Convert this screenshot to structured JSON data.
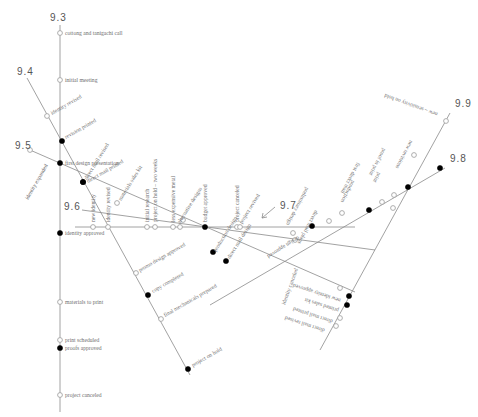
{
  "diagram": {
    "lines": [
      {
        "id": "9.3",
        "label": "9.3",
        "x1": 60,
        "y1": 25,
        "x2": 60,
        "y2": 412,
        "label_x": 50,
        "label_y": 21
      },
      {
        "id": "9.4",
        "label": "9.4",
        "x1": 27,
        "y1": 78,
        "x2": 190,
        "y2": 375,
        "label_x": 17,
        "label_y": 75
      },
      {
        "id": "9.5",
        "label": "9.5",
        "x1": 30,
        "y1": 150,
        "x2": 355,
        "y2": 292,
        "label_x": 15,
        "label_y": 149
      },
      {
        "id": "9.6",
        "label": "9.6",
        "x1": 82,
        "y1": 210,
        "x2": 375,
        "y2": 250,
        "label_x": 64,
        "label_y": 210
      },
      {
        "id": "9.7",
        "label": "9.7",
        "x1": 75,
        "y1": 227,
        "x2": 355,
        "y2": 227,
        "label_x": 280,
        "label_y": 209
      },
      {
        "id": "9.8",
        "label": "9.8",
        "x1": 210,
        "y1": 305,
        "x2": 445,
        "y2": 168,
        "label_x": 450,
        "label_y": 162
      },
      {
        "id": "9.9",
        "label": "9.9",
        "x1": 320,
        "y1": 350,
        "x2": 450,
        "y2": 113,
        "label_x": 455,
        "label_y": 107
      }
    ],
    "arrow": {
      "x1": 262,
      "y1": 218,
      "x2": 275,
      "y2": 207
    },
    "events": [
      {
        "line": "9.3",
        "x": 60,
        "y": 33,
        "filled": false,
        "label": "cottong and tanigachi call",
        "lx": 65,
        "ly": 35,
        "rot": 0
      },
      {
        "line": "9.3",
        "x": 60,
        "y": 80,
        "filled": false,
        "label": "initial meeting",
        "lx": 65,
        "ly": 82,
        "rot": 0
      },
      {
        "line": "9.3",
        "x": 60,
        "y": 163,
        "filled": true,
        "label": "first design presentation",
        "lx": 65,
        "ly": 165,
        "rot": 0
      },
      {
        "line": "9.3",
        "x": 60,
        "y": 233,
        "filled": true,
        "label": "identity approved",
        "lx": 65,
        "ly": 235,
        "rot": 0
      },
      {
        "line": "9.3",
        "x": 60,
        "y": 302,
        "filled": false,
        "label": "materials to print",
        "lx": 65,
        "ly": 304,
        "rot": 0
      },
      {
        "line": "9.3",
        "x": 60,
        "y": 340,
        "filled": false,
        "label": "print scheduled",
        "lx": 65,
        "ly": 342,
        "rot": 0
      },
      {
        "line": "9.3",
        "x": 60,
        "y": 348,
        "filled": true,
        "label": "proofs approved",
        "lx": 65,
        "ly": 350,
        "rot": 0
      },
      {
        "line": "9.3",
        "x": 60,
        "y": 395,
        "filled": false,
        "label": "project canceled",
        "lx": 65,
        "ly": 397,
        "rot": 0
      },
      {
        "line": "9.4",
        "x": 47,
        "y": 116,
        "filled": false,
        "label": "identity revised",
        "lx": 52,
        "ly": 115,
        "rot": -30
      },
      {
        "line": "9.4",
        "x": 62,
        "y": 141,
        "filled": true,
        "label": "revision printed",
        "lx": 66,
        "ly": 139,
        "rot": -30
      },
      {
        "line": "9.4",
        "x": 83,
        "y": 182,
        "filled": true,
        "label": "direct mail revised",
        "lx": 87,
        "ly": 180,
        "rot": -58
      },
      {
        "line": "9.4",
        "x": 83,
        "y": 182,
        "filled": true,
        "label": "direct mail printed",
        "lx": 88,
        "ly": 183,
        "rot": -30
      },
      {
        "line": "9.4",
        "x": 136,
        "y": 273,
        "filled": false,
        "label": "promo design approved",
        "lx": 140,
        "ly": 272,
        "rot": -30
      },
      {
        "line": "9.4",
        "x": 148,
        "y": 295,
        "filled": true,
        "label": "copy completed",
        "lx": 153,
        "ly": 293,
        "rot": -30
      },
      {
        "line": "9.4",
        "x": 161,
        "y": 319,
        "filled": false,
        "label": "final mechanicals prepared",
        "lx": 165,
        "ly": 317,
        "rot": -30
      },
      {
        "line": "9.4",
        "x": 188,
        "y": 369,
        "filled": true,
        "label": "project on hold",
        "lx": 193,
        "ly": 367,
        "rot": -30
      },
      {
        "line": "9.5",
        "x": 117,
        "y": 203,
        "filled": false,
        "label": "materials sales kit",
        "lx": 121,
        "ly": 201,
        "rot": -58
      },
      {
        "line": "9.5",
        "x": 213,
        "y": 252,
        "filled": true,
        "label": "production design",
        "lx": 216,
        "ly": 252,
        "rot": -58
      },
      {
        "line": "9.5",
        "x": 226,
        "y": 261,
        "filled": true,
        "label": "direct mail design",
        "lx": 230,
        "ly": 259,
        "rot": -58
      },
      {
        "line": "9.5",
        "x": 340,
        "y": 288,
        "filled": false,
        "label": "",
        "lx": 0,
        "ly": 0,
        "rot": 0
      },
      {
        "line": "9.6",
        "x": 183,
        "y": 220,
        "filled": false,
        "label": "",
        "lx": 0,
        "ly": 0,
        "rot": 0
      },
      {
        "line": "9.7",
        "x": 93,
        "y": 227,
        "filled": false,
        "label": "new identity",
        "lx": 95,
        "ly": 222,
        "rot": -90
      },
      {
        "line": "9.7",
        "x": 108,
        "y": 227,
        "filled": false,
        "label": "identity revised",
        "lx": 110,
        "ly": 222,
        "rot": -90
      },
      {
        "line": "9.7",
        "x": 147,
        "y": 227,
        "filled": false,
        "label": "initial research",
        "lx": 149,
        "ly": 222,
        "rot": -90
      },
      {
        "line": "9.7",
        "x": 155,
        "y": 227,
        "filled": false,
        "label": "project on hold – two weeks",
        "lx": 157,
        "ly": 222,
        "rot": -90
      },
      {
        "line": "9.7",
        "x": 173,
        "y": 227,
        "filled": false,
        "label": "less expensive metal",
        "lx": 175,
        "ly": 222,
        "rot": -90
      },
      {
        "line": "9.7",
        "x": 180,
        "y": 227,
        "filled": false,
        "label": "alternative designs",
        "lx": 180,
        "ly": 224,
        "rot": -58
      },
      {
        "line": "9.7",
        "x": 205,
        "y": 227,
        "filled": true,
        "label": "budget approved",
        "lx": 207,
        "ly": 222,
        "rot": -90
      },
      {
        "line": "9.7",
        "x": 237,
        "y": 227,
        "filled": false,
        "label": "project canceled",
        "lx": 239,
        "ly": 222,
        "rot": -90
      },
      {
        "line": "9.7",
        "x": 240,
        "y": 227,
        "filled": false,
        "label": "project revived",
        "lx": 242,
        "ly": 224,
        "rot": -58
      },
      {
        "line": "9.8",
        "x": 293,
        "y": 233,
        "filled": false,
        "label": "design approved",
        "lx": 298,
        "ly": 236,
        "rot": 148
      },
      {
        "line": "9.8",
        "x": 312,
        "y": 226,
        "filled": true,
        "label": "",
        "lx": 0,
        "ly": 0,
        "rot": 0
      },
      {
        "line": "9.8",
        "x": 329,
        "y": 221,
        "filled": false,
        "label": "direct mail plans",
        "lx": 315,
        "ly": 210,
        "rot": 118
      },
      {
        "line": "9.8",
        "x": 342,
        "y": 213,
        "filled": false,
        "label": "preliminary design",
        "lx": 306,
        "ly": 187,
        "rot": 118
      },
      {
        "line": "9.8",
        "x": 369,
        "y": 210,
        "filled": true,
        "label": "production",
        "lx": 352,
        "ly": 180,
        "rot": 118
      },
      {
        "line": "9.8",
        "x": 382,
        "y": 202,
        "filled": false,
        "label": "first direct mail",
        "lx": 357,
        "ly": 162,
        "rot": 118
      },
      {
        "line": "9.8",
        "x": 394,
        "y": 195,
        "filled": false,
        "label": "print",
        "lx": 378,
        "ly": 172,
        "rot": 118
      },
      {
        "line": "9.8",
        "x": 408,
        "y": 187,
        "filled": true,
        "label": "proof in print",
        "lx": 383,
        "ly": 148,
        "rot": 118
      },
      {
        "line": "9.8",
        "x": 440,
        "y": 168,
        "filled": true,
        "label": "",
        "lx": 0,
        "ly": 0,
        "rot": 0
      },
      {
        "line": "9.9",
        "x": 393,
        "y": 208,
        "filled": false,
        "label": "",
        "lx": 0,
        "ly": 0,
        "rot": 0
      },
      {
        "line": "9.9",
        "x": 349,
        "y": 296,
        "filled": true,
        "label": "new identity approved",
        "lx": 341,
        "ly": 299,
        "rot": 198
      },
      {
        "line": "9.9",
        "x": 347,
        "y": 305,
        "filled": true,
        "label": "printed sales kit",
        "lx": 339,
        "ly": 309,
        "rot": 198
      },
      {
        "line": "9.9",
        "x": 340,
        "y": 318,
        "filled": false,
        "label": "direct mail printed",
        "lx": 333,
        "ly": 320,
        "rot": 198
      },
      {
        "line": "9.9",
        "x": 336,
        "y": 326,
        "filled": false,
        "label": "direct mail revised",
        "lx": 325,
        "ly": 329,
        "rot": 198
      },
      {
        "line": "9.9",
        "x": 446,
        "y": 121,
        "filled": false,
        "label": "new – sensitivity on hold",
        "lx": 438,
        "ly": 113,
        "rot": 200
      },
      {
        "line": "9.9",
        "x": 414,
        "y": 155,
        "filled": false,
        "label": "new revisions",
        "lx": 410,
        "ly": 140,
        "rot": 118
      },
      {
        "line": "9.5",
        "x": 295,
        "y": 240,
        "filled": false,
        "label": "identity canceled",
        "lx": 285,
        "ly": 305,
        "rot": -70
      },
      {
        "line": "9.5",
        "x": 30,
        "y": 150,
        "filled": false,
        "label": "identity expanded",
        "lx": 28,
        "ly": 200,
        "rot": -60
      }
    ]
  }
}
